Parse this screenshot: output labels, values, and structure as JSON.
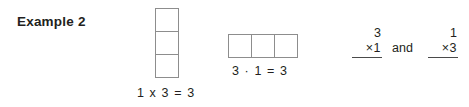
{
  "page": {
    "background_color": "#ffffff",
    "text_color": "#231f20",
    "grid_border_color": "#8d8d8d"
  },
  "example": {
    "label": "Example 2"
  },
  "column_model": {
    "orientation": "vertical",
    "rows": 3,
    "columns": 1,
    "cells": [
      "",
      "",
      ""
    ],
    "caption": "1 x 3 = 3"
  },
  "row_model": {
    "orientation": "horizontal",
    "rows": 1,
    "columns": 3,
    "cells": [
      "",
      "",
      ""
    ],
    "caption": "3 · 1 = 3"
  },
  "expressions": {
    "conjunction": "and",
    "left": {
      "top_factor": "3",
      "bottom_factor": "×1"
    },
    "right": {
      "top_factor": "1",
      "bottom_factor": "×3"
    }
  }
}
